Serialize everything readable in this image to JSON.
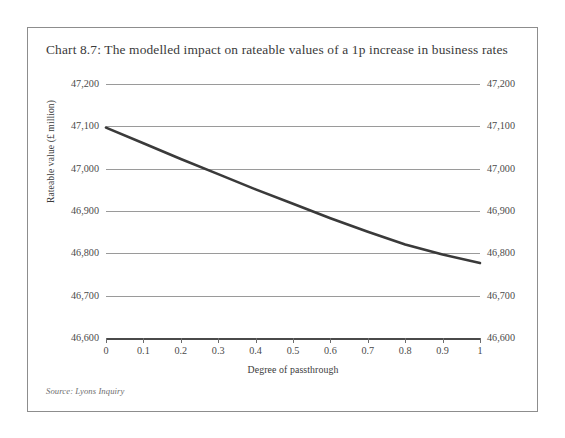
{
  "figure": {
    "title": "Chart 8.7: The modelled impact on rateable values of a 1p increase in business rates",
    "source": "Source: Lyons Inquiry"
  },
  "chart_data": {
    "type": "line",
    "title": "Chart 8.7: The modelled impact on rateable values of a 1p increase in business rates",
    "xlabel": "Degree of passthrough",
    "ylabel": "Rateable value (£ million)",
    "xlim": [
      0,
      1
    ],
    "ylim": [
      46600,
      47200
    ],
    "xticks": [
      0,
      0.1,
      0.2,
      0.3,
      0.4,
      0.5,
      0.6,
      0.7,
      0.8,
      0.9,
      1
    ],
    "xtick_labels": [
      "0",
      "0.1",
      "0.2",
      "0.3",
      "0.4",
      "0.5",
      "0.6",
      "0.7",
      "0.8",
      "0.9",
      "1"
    ],
    "yticks": [
      46600,
      46700,
      46800,
      46900,
      47000,
      47100,
      47200
    ],
    "ytick_labels": [
      "46,600",
      "46,700",
      "46,800",
      "46,900",
      "47,000",
      "47,100",
      "47,200"
    ],
    "ytick_labels_right": [
      "46,600",
      "46,700",
      "46,800",
      "46,900",
      "47,000",
      "47,100",
      "47,200"
    ],
    "grid": "horizontal",
    "legend": null,
    "series": [
      {
        "name": "Rateable value",
        "color": "#3a3a3a",
        "linewidth": 2.6,
        "x": [
          0,
          0.1,
          0.2,
          0.3,
          0.4,
          0.5,
          0.6,
          0.7,
          0.8,
          0.9,
          1
        ],
        "values": [
          47097,
          47060,
          47023,
          46987,
          46951,
          46917,
          46883,
          46851,
          46821,
          46797,
          46777
        ]
      }
    ]
  }
}
